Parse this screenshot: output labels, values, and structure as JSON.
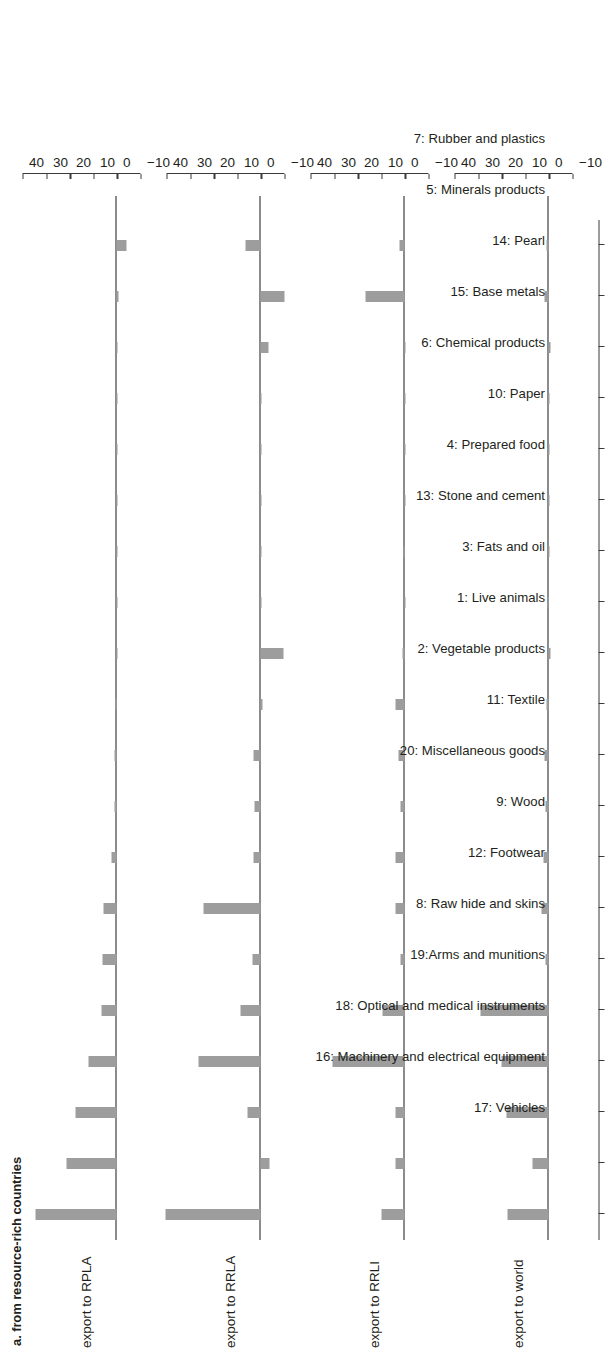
{
  "figure": {
    "title": "a. from resource-rich countries",
    "bar_color": "#9d9d9d",
    "axis_color": "#3a3a3a"
  },
  "chart_data": {
    "type": "bar",
    "title": "a. from resource-rich countries",
    "xlabel": "",
    "ylabel": "",
    "ylim": [
      -10,
      40
    ],
    "yticks": [
      -10,
      0,
      10,
      20,
      30,
      40
    ],
    "ytick_labels": [
      "−10",
      "0",
      "10",
      "20",
      "30",
      "40"
    ],
    "grid": false,
    "legend": "none",
    "orientation": "page-rotated-90-ccw",
    "categories": [
      "7: Rubber and plastics",
      "5: Minerals products",
      "14: Pearl",
      "15: Base metals",
      "6: Chemical products",
      "10: Paper",
      "4: Prepared food",
      "13: Stone and cement",
      "3: Fats and oil",
      "1: Live animals",
      "2: Vegetable products",
      "11: Textile",
      "20: Miscellaneous goods",
      "9: Wood",
      "12: Footwear",
      "8: Raw hide and skins",
      "19:Arms and munitions",
      "18: Optical and medical instruments",
      "16: Machinery and electrical equipment",
      "17: Vehicles"
    ],
    "series": [
      {
        "name": "export to RPLA",
        "values": [
          34.5,
          21.5,
          17.5,
          12.0,
          6.5,
          6.0,
          5.5,
          2.2,
          1.2,
          0.9,
          0.5,
          0.2,
          0.15,
          0.1,
          0.05,
          0.05,
          0.0,
          0.0,
          -0.6,
          -4.2
        ]
      },
      {
        "name": "export to RRLA",
        "values": [
          40.5,
          -3.5,
          5.5,
          26.5,
          8.5,
          3.5,
          24.5,
          3.0,
          2.8,
          3.0,
          -0.5,
          -9.5,
          0.3,
          0.1,
          0.0,
          0.0,
          0.0,
          -3.2,
          -9.8,
          6.5
        ]
      },
      {
        "name": "export to RRLI",
        "values": [
          10.0,
          4.0,
          4.2,
          30.8,
          9.5,
          2.0,
          4.0,
          4.2,
          1.8,
          2.8,
          4.0,
          1.2,
          0.1,
          0.8,
          0.2,
          0.0,
          0.0,
          0.0,
          16.5,
          2.5
        ]
      },
      {
        "name": "export to world",
        "values": [
          17.5,
          7.0,
          18.0,
          20.0,
          29.0,
          1.3,
          3.2,
          2.3,
          1.6,
          2.0,
          1.0,
          -0.8,
          0.6,
          0.05,
          0.0,
          0.0,
          0.0,
          -0.5,
          2.0,
          1.0
        ]
      }
    ]
  },
  "panels": [
    {
      "label": "export to RPLA"
    },
    {
      "label": "export to RRLA"
    },
    {
      "label": "export to RRLI"
    },
    {
      "label": "export to world"
    }
  ]
}
